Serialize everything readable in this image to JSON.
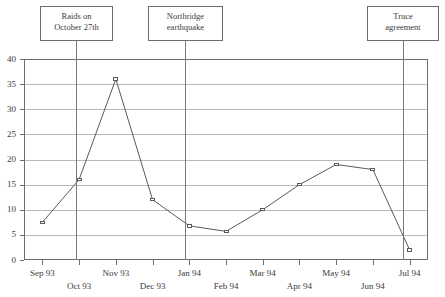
{
  "chart_data": {
    "type": "line",
    "title": "",
    "xlabel": "",
    "ylabel": "",
    "categories": [
      "Sep 93",
      "Oct 93",
      "Nov 93",
      "Dec 93",
      "Jan 94",
      "Feb 94",
      "Mar 94",
      "Apr 94",
      "May 94",
      "Jun 94",
      "Jul 94"
    ],
    "values": [
      7.5,
      16,
      36,
      12,
      6.8,
      5.7,
      10,
      15,
      19,
      18,
      2
    ],
    "series": [
      {
        "name": "",
        "values": [
          7.5,
          16,
          36,
          12,
          6.8,
          5.7,
          10,
          15,
          19,
          18,
          2
        ]
      }
    ],
    "ylim": [
      0,
      40
    ],
    "ytick_labels": [
      "0",
      "5",
      "10",
      "15",
      "20",
      "25",
      "30",
      "35",
      "40"
    ],
    "ytick_values": [
      0,
      5,
      10,
      15,
      20,
      25,
      30,
      35,
      40
    ],
    "grid": "horizontal",
    "legend": "none",
    "marker": "open-square",
    "line_color": "#5a5a5a",
    "grid_color": "#b9b9b9",
    "axis_color": "#6d6d6d",
    "annotations": [
      {
        "text_lines": [
          "Raids on",
          "October 27th"
        ],
        "at_category": "Oct 93"
      },
      {
        "text_lines": [
          "Northridge",
          "earthquake"
        ],
        "at_category": "Jan 94"
      },
      {
        "text_lines": [
          "Truce",
          "agreement"
        ],
        "at_category": "Jul 94"
      }
    ]
  },
  "caption": ""
}
